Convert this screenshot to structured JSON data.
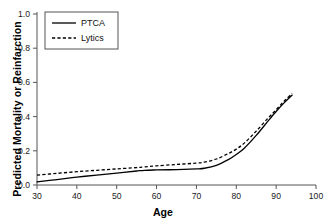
{
  "chart_data": {
    "type": "line",
    "title": "",
    "xlabel": "Age",
    "ylabel": "Predicted Mortality or Reinfarction",
    "xlim": [
      30,
      100
    ],
    "ylim": [
      0.0,
      1.0
    ],
    "xticks": [
      30,
      40,
      50,
      60,
      70,
      80,
      90,
      100
    ],
    "xtick_labels": [
      "30",
      "40",
      "50",
      "60",
      "70",
      "80",
      "90",
      "100"
    ],
    "yticks": [
      0.0,
      0.2,
      0.4,
      0.6,
      0.8,
      1.0
    ],
    "ytick_labels": [
      "0.0",
      "0.2",
      "0.4",
      "0.6",
      "0.8",
      "1.0"
    ],
    "grid": false,
    "legend_position": "upper left",
    "x": [
      30,
      35,
      40,
      45,
      50,
      55,
      57,
      60,
      65,
      70,
      72,
      75,
      78,
      80,
      82,
      85,
      88,
      90,
      92,
      94
    ],
    "series": [
      {
        "name": "PTCA",
        "style": "solid",
        "color": "#000000",
        "values": [
          0.018,
          0.032,
          0.046,
          0.058,
          0.07,
          0.082,
          0.086,
          0.088,
          0.09,
          0.094,
          0.098,
          0.115,
          0.148,
          0.178,
          0.215,
          0.29,
          0.375,
          0.43,
          0.48,
          0.525
        ]
      },
      {
        "name": "Lytics",
        "style": "dashed",
        "color": "#000000",
        "values": [
          0.058,
          0.068,
          0.078,
          0.086,
          0.094,
          0.102,
          0.106,
          0.112,
          0.12,
          0.128,
          0.134,
          0.152,
          0.184,
          0.21,
          0.245,
          0.315,
          0.392,
          0.44,
          0.49,
          0.535
        ]
      }
    ]
  },
  "legend": {
    "entries": [
      {
        "label": "PTCA",
        "style": "solid"
      },
      {
        "label": "Lytics",
        "style": "dashed"
      }
    ]
  },
  "axes": {
    "x_title": "Age",
    "y_title": "Predicted Mortality or Reinfarction"
  }
}
